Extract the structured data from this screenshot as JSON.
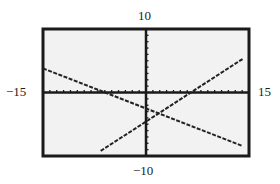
{
  "chart_data": {
    "type": "line",
    "title": "",
    "xlabel": "",
    "ylabel": "",
    "xlim": [
      -15,
      15
    ],
    "ylim": [
      -10,
      10
    ],
    "xscale_ticks": 1,
    "yscale_ticks": 1,
    "grid": false,
    "window_labels": {
      "ymax": "10",
      "ymin": "−10",
      "xmin": "−15",
      "xmax": "15"
    },
    "series": [
      {
        "name": "decreasing line",
        "x": [
          -15,
          14
        ],
        "y": [
          3.8,
          -8.4
        ],
        "style": "dotted"
      },
      {
        "name": "increasing line",
        "x": [
          -6.6,
          14.1
        ],
        "y": [
          -9.2,
          5.3
        ],
        "style": "dotted"
      }
    ],
    "intersection": {
      "x": 1.5,
      "y": -3.1
    }
  },
  "colors": {
    "frame": "#1a1a1a",
    "background": "#f2f2f2",
    "plot": "#222222"
  }
}
